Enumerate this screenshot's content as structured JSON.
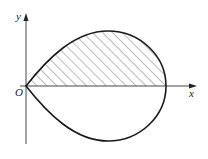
{
  "figure": {
    "axes": {
      "x_label": "x",
      "y_label": "y",
      "origin_label": "O"
    },
    "curve": {
      "shape": "teardrop closed loop through origin, symmetric about x-axis",
      "stroke_color": "#1a1a1a"
    },
    "shaded_region": {
      "description": "upper half of loop above x-axis",
      "pattern": "diagonal hatching",
      "hatch_color": "#555555"
    }
  }
}
